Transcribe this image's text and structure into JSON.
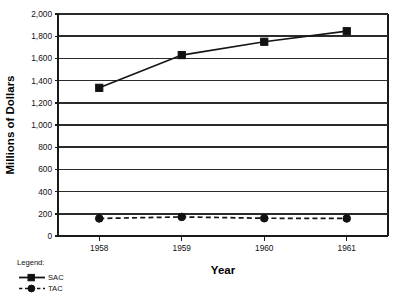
{
  "chart_data": {
    "type": "line",
    "title": "",
    "xlabel": "Year",
    "ylabel": "Millions of Dollars",
    "categories": [
      "1958",
      "1959",
      "1960",
      "1961"
    ],
    "ylim": [
      0,
      2000
    ],
    "ytick_values": [
      0,
      200,
      400,
      600,
      800,
      1000,
      1200,
      1400,
      1600,
      1800,
      2000
    ],
    "ytick_labels": [
      "0",
      "200",
      "400",
      "600",
      "800",
      "1,000",
      "1,200",
      "1,400",
      "1,600",
      "1,800",
      "2,000"
    ],
    "grid": "horizontal",
    "legend_position": "bottom-left",
    "series": [
      {
        "name": "SAC",
        "marker": "square",
        "line_style": "solid",
        "color": "#151515",
        "values": [
          1335,
          1630,
          1750,
          1845
        ]
      },
      {
        "name": "TAC",
        "marker": "circle",
        "line_style": "dashed",
        "color": "#151515",
        "values": [
          158,
          172,
          160,
          158
        ]
      }
    ]
  },
  "legend": {
    "heading": "Legend:",
    "entries": [
      {
        "label": "SAC"
      },
      {
        "label": "TAC"
      }
    ]
  },
  "axes": {
    "y_title": "Millions of Dollars",
    "x_title": "Year"
  }
}
